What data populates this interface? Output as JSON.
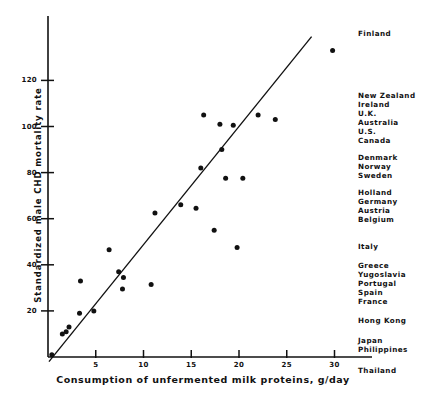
{
  "chart_data": {
    "type": "scatter",
    "title": "",
    "xlabel": "Consumption of unfermented milk proteins, g/day",
    "ylabel": "Standardized male CHD mortality rate",
    "xlim": [
      0,
      31.5
    ],
    "ylim": [
      0,
      145
    ],
    "xticks": [
      5,
      10,
      15,
      20,
      25,
      30
    ],
    "yticks": [
      20,
      40,
      60,
      80,
      100,
      120
    ],
    "grid": false,
    "legend": "none",
    "points": [
      {
        "x": 0.4,
        "y": 1
      },
      {
        "x": 1.5,
        "y": 10
      },
      {
        "x": 1.9,
        "y": 11
      },
      {
        "x": 2.2,
        "y": 13
      },
      {
        "x": 3.3,
        "y": 19
      },
      {
        "x": 3.4,
        "y": 33
      },
      {
        "x": 4.8,
        "y": 20
      },
      {
        "x": 6.4,
        "y": 46.5
      },
      {
        "x": 7.4,
        "y": 37
      },
      {
        "x": 7.9,
        "y": 34.5
      },
      {
        "x": 7.8,
        "y": 29.5
      },
      {
        "x": 10.8,
        "y": 31.5
      },
      {
        "x": 11.2,
        "y": 62.5
      },
      {
        "x": 13.9,
        "y": 66
      },
      {
        "x": 15.5,
        "y": 64.5
      },
      {
        "x": 16.0,
        "y": 82
      },
      {
        "x": 16.3,
        "y": 105
      },
      {
        "x": 17.4,
        "y": 55
      },
      {
        "x": 18.0,
        "y": 101
      },
      {
        "x": 18.2,
        "y": 90
      },
      {
        "x": 18.6,
        "y": 77.5
      },
      {
        "x": 19.4,
        "y": 100.5
      },
      {
        "x": 19.8,
        "y": 47.5
      },
      {
        "x": 20.4,
        "y": 77.5
      },
      {
        "x": 22.0,
        "y": 105
      },
      {
        "x": 23.8,
        "y": 103
      },
      {
        "x": 29.8,
        "y": 133
      }
    ],
    "trend_line": {
      "x_start": 0.1,
      "y_start": -2,
      "x_end": 27.6,
      "y_end": 139
    },
    "annotations": [
      {
        "label": "Finland",
        "y": 30
      },
      {
        "label": "New Zealand",
        "y": 92
      },
      {
        "label": "Ireland",
        "y": 101
      },
      {
        "label": "U.K.",
        "y": 110
      },
      {
        "label": "Australia",
        "y": 119
      },
      {
        "label": "U.S.",
        "y": 128
      },
      {
        "label": "Canada",
        "y": 137
      },
      {
        "label": "Denmark",
        "y": 154
      },
      {
        "label": "Norway",
        "y": 163
      },
      {
        "label": "Sweden",
        "y": 172
      },
      {
        "label": "Holland",
        "y": 189
      },
      {
        "label": "Germany",
        "y": 198
      },
      {
        "label": "Austria",
        "y": 207
      },
      {
        "label": "Belgium",
        "y": 216
      },
      {
        "label": "Italy",
        "y": 243
      },
      {
        "label": "Greece",
        "y": 262
      },
      {
        "label": "Yugoslavia",
        "y": 271
      },
      {
        "label": "Portugal",
        "y": 280
      },
      {
        "label": "Spain",
        "y": 289
      },
      {
        "label": "France",
        "y": 298
      },
      {
        "label": "Hong Kong",
        "y": 317
      },
      {
        "label": "Japan",
        "y": 337
      },
      {
        "label": "Philippines",
        "y": 346
      },
      {
        "label": "Thailand",
        "y": 367
      }
    ]
  }
}
